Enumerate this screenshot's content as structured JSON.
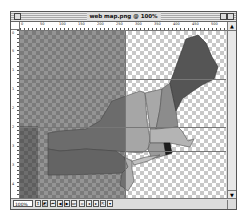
{
  "window": {
    "title": "web map.png @ 100%",
    "zoom_level": "100%"
  },
  "rulers": {
    "horizontal_ticks": [
      "0",
      "50",
      "100",
      "150",
      "200",
      "250",
      "300",
      "350",
      "400",
      "450",
      "500"
    ],
    "vertical_ticks": [
      "0",
      "5",
      "1",
      "1",
      "2",
      "2",
      "3",
      "3",
      "4",
      "4"
    ]
  },
  "canvas": {
    "content": "Map of northeastern United States states over transparency checkerboard",
    "regions": [
      "Maine",
      "New Hampshire",
      "Vermont",
      "Massachusetts",
      "Connecticut",
      "Rhode Island",
      "New York",
      "Pennsylvania",
      "New Jersey"
    ],
    "colors": {
      "maine": "#555555",
      "new_hampshire": "#8c8c8c",
      "vermont": "#a8a8a8",
      "massachusetts": "#b4b4b4",
      "connecticut": "#9a9a9a",
      "rhode_island": "#1e1e1e",
      "new_york": "#a6a6a6",
      "pennsylvania": "#959595",
      "new_jersey": "#b0b0b0",
      "checker_dark": "#c8c8c8",
      "checker_light": "#ffffff"
    }
  },
  "statusbar": {
    "zoom": "100%",
    "buttons": [
      "up-down",
      "preview",
      "first-frame",
      "prev-frame",
      "play",
      "next-frame",
      "slice-a",
      "slice-b",
      "slice-c",
      "jump",
      "options"
    ]
  },
  "scrollbar": {
    "up": "▲",
    "down": "▼"
  }
}
